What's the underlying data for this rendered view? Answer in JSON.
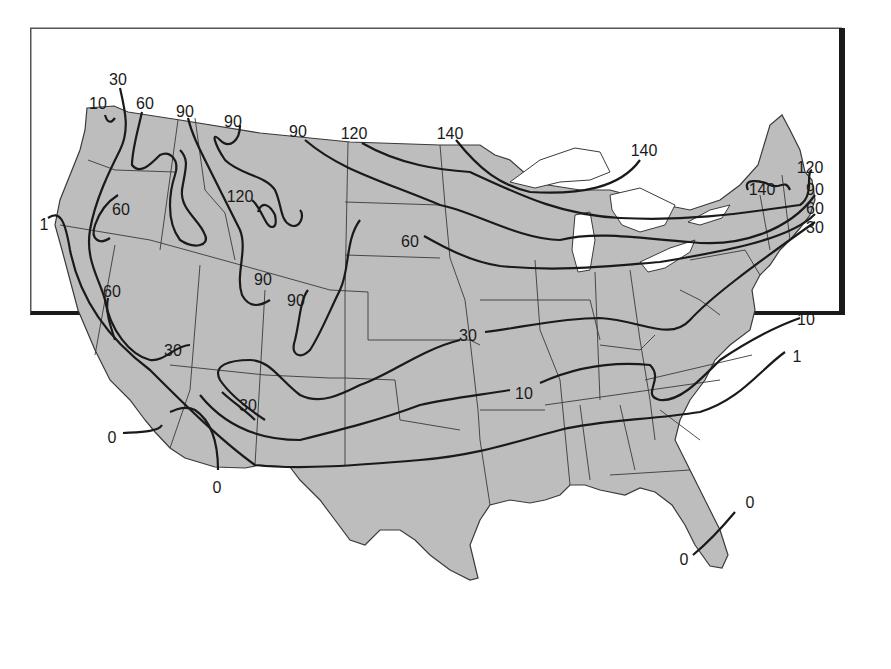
{
  "map": {
    "type": "isoline",
    "region": "Continental United States",
    "colors": {
      "land": "#bdbdbd",
      "water": "#ffffff",
      "contour": "#1a1a1a",
      "border": "#3a3a3a",
      "frame": "#1a1a1a"
    },
    "contour_values": [
      0,
      1,
      10,
      30,
      60,
      90,
      120,
      140
    ],
    "labels": [
      {
        "text": "30",
        "x": 118,
        "y": 80
      },
      {
        "text": "10",
        "x": 98,
        "y": 104
      },
      {
        "text": "60",
        "x": 145,
        "y": 104
      },
      {
        "text": "90",
        "x": 185,
        "y": 112
      },
      {
        "text": "90",
        "x": 233,
        "y": 122
      },
      {
        "text": "90",
        "x": 298,
        "y": 132
      },
      {
        "text": "120",
        "x": 354,
        "y": 134
      },
      {
        "text": "140",
        "x": 450,
        "y": 134
      },
      {
        "text": "140",
        "x": 644,
        "y": 151
      },
      {
        "text": "120",
        "x": 810,
        "y": 168
      },
      {
        "text": "140",
        "x": 762,
        "y": 190
      },
      {
        "text": "90",
        "x": 815,
        "y": 190
      },
      {
        "text": "60",
        "x": 815,
        "y": 209
      },
      {
        "text": "30",
        "x": 815,
        "y": 228
      },
      {
        "text": "120",
        "x": 240,
        "y": 197
      },
      {
        "text": "60",
        "x": 121,
        "y": 210
      },
      {
        "text": "1",
        "x": 44,
        "y": 225
      },
      {
        "text": "60",
        "x": 410,
        "y": 242
      },
      {
        "text": "90",
        "x": 263,
        "y": 280
      },
      {
        "text": "90",
        "x": 296,
        "y": 301
      },
      {
        "text": "60",
        "x": 112,
        "y": 292
      },
      {
        "text": "30",
        "x": 173,
        "y": 351
      },
      {
        "text": "30",
        "x": 468,
        "y": 336
      },
      {
        "text": "10",
        "x": 806,
        "y": 320
      },
      {
        "text": "1",
        "x": 797,
        "y": 357
      },
      {
        "text": "30",
        "x": 248,
        "y": 406
      },
      {
        "text": "10",
        "x": 524,
        "y": 394
      },
      {
        "text": "0",
        "x": 112,
        "y": 438
      },
      {
        "text": "0",
        "x": 217,
        "y": 488
      },
      {
        "text": "0",
        "x": 750,
        "y": 503
      },
      {
        "text": "0",
        "x": 684,
        "y": 560
      }
    ]
  }
}
